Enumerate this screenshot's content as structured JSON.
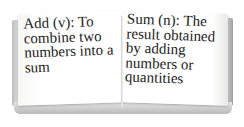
{
  "book": {
    "left_page": {
      "term": "Add",
      "part_of_speech": "(v)",
      "definition_text": "Add (v): To combine two numbers into a sum"
    },
    "right_page": {
      "term": "Sum",
      "part_of_speech": "(n)",
      "definition_text": "Sum (n): The result obtained by adding numbers or quantities"
    }
  }
}
